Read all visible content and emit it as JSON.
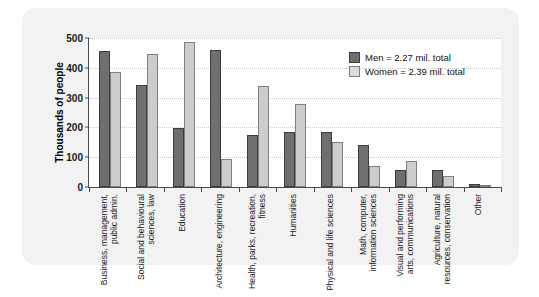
{
  "chart_data": {
    "type": "bar",
    "title": "",
    "xlabel": "",
    "ylabel": "Thousands of people",
    "ylim": [
      0,
      500
    ],
    "yticks": [
      0,
      100,
      200,
      300,
      400,
      500
    ],
    "grid": true,
    "legend_position": "top-right",
    "categories": [
      "Business, management,\npublic admin.",
      "Social and behavioural\nsciences, law",
      "Education",
      "Architecture, engineering",
      "Health, parks, recreation,\nfitness",
      "Humanities",
      "Physical and life sciences",
      "Math, computer,\ninformation sciences",
      "Visual and performing\narts, communications",
      "Agriculture, natural\nresources, conservation",
      "Other"
    ],
    "category_lines": [
      [
        "Business, management,",
        "public admin."
      ],
      [
        "Social and behavioural",
        "sciences, law"
      ],
      [
        "Education"
      ],
      [
        "Architecture, engineering"
      ],
      [
        "Health, parks, recreation,",
        "fitness"
      ],
      [
        "Humanities"
      ],
      [
        "Physical and life sciences"
      ],
      [
        "Math, computer,",
        "information sciences"
      ],
      [
        "Visual and performing",
        "arts, communications"
      ],
      [
        "Agriculture, natural",
        "resources, conservation"
      ],
      [
        "Other"
      ]
    ],
    "series": [
      {
        "name": "Men = 2.27 mil. total",
        "short_name": "Men",
        "color": "#6f6f6f",
        "values": [
          457,
          342,
          199,
          460,
          175,
          186,
          186,
          140,
          58,
          57,
          9
        ]
      },
      {
        "name": "Women = 2.39 mil. total",
        "short_name": "Women",
        "color": "#cdcdcd",
        "values": [
          387,
          445,
          485,
          95,
          338,
          277,
          151,
          72,
          88,
          37,
          7
        ]
      }
    ]
  },
  "legend": {
    "items": [
      {
        "label": "Men = 2.27 mil. total"
      },
      {
        "label": "Women = 2.39 mil. total"
      }
    ]
  },
  "axis": {
    "y_title": "Thousands of people",
    "y_tick_labels": [
      "500",
      "400",
      "300",
      "200",
      "100",
      "0"
    ]
  },
  "colors": {
    "men": "#6f6f6f",
    "women": "#cdcdcd",
    "panel": "#f2f2f2",
    "plot_background": "#ffffff",
    "axis": "#4a4a4a",
    "gridline": "#c9c9c9"
  }
}
